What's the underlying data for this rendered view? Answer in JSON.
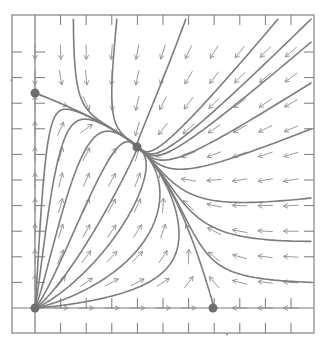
{
  "diagram": {
    "type": "phase-portrait",
    "colors": {
      "frame": "#8a8a8a",
      "axes": "#7a7a7a",
      "ticks": "#7a7a7a",
      "trajectory": "#7d7d7d",
      "arrow": "#8c8c8c",
      "equilibrium": "#6e6e6e",
      "background": "#ffffff"
    },
    "equilibria": [
      {
        "name": "origin",
        "px": [
          35,
          308
        ],
        "type": "unstable-node"
      },
      {
        "name": "y-axis-point",
        "px": [
          35,
          93
        ],
        "type": "saddle"
      },
      {
        "name": "interior-point",
        "px": [
          137,
          147
        ],
        "type": "stable-node"
      },
      {
        "name": "x-axis-point",
        "px": [
          213,
          308
        ],
        "type": "saddle"
      }
    ],
    "grid": {
      "origin_px": [
        35,
        308
      ],
      "spacing_px": 25.6,
      "cols": 11,
      "rows": 11
    }
  }
}
